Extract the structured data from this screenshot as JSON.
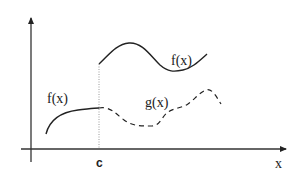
{
  "diagram": {
    "labels": {
      "f_lower": "f(x)",
      "f_upper": "f(x)",
      "g": "g(x)",
      "c": "c",
      "x_axis": "x"
    },
    "colors": {
      "stroke": "#222222",
      "guide": "#888888"
    }
  }
}
